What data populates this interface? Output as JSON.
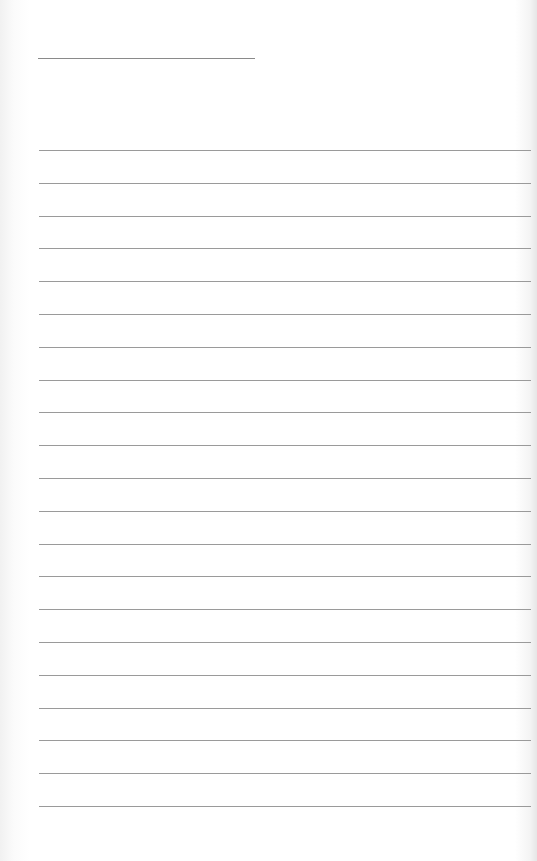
{
  "page": {
    "type": "lined-paper",
    "title_line": {
      "left": 38,
      "top": 58,
      "width": 217
    },
    "rules": {
      "left": 39,
      "width": 492,
      "first_top": 150,
      "spacing": 32.8,
      "count": 21,
      "color": "#9a9a9a"
    },
    "background_color": "#ffffff"
  }
}
